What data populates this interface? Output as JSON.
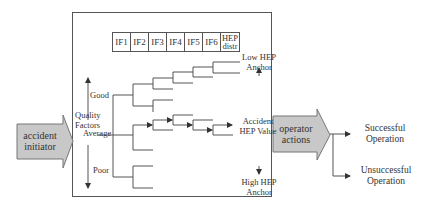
{
  "diagram": {
    "input_arrow": {
      "label_line1": "accident",
      "label_line2": "initiator",
      "fill": "#c8c8c8"
    },
    "output_arrow": {
      "label_line1": "operator",
      "label_line2": "actions",
      "fill": "#c8c8c8"
    },
    "influence_factors": [
      "IF1",
      "IF2",
      "IF3",
      "IF4",
      "IF5",
      "IF6"
    ],
    "hep_distr": {
      "line1": "HEP",
      "line2": "distr"
    },
    "quality_axis": {
      "title_line1": "Quality",
      "title_line2": "Factors",
      "levels": {
        "good": "Good",
        "average": "Average",
        "poor": "Poor"
      }
    },
    "anchors": {
      "low": {
        "line1": "Low HEP",
        "line2": "Anchor"
      },
      "value": {
        "line1": "Accident",
        "line2": "HEP Value"
      },
      "high": {
        "line1": "High HEP",
        "line2": "Anchor"
      }
    },
    "outcomes": {
      "success": {
        "line1": "Successful",
        "line2": "Operation"
      },
      "failure": {
        "line1": "Unsuccessful",
        "line2": "Operation"
      }
    },
    "colors": {
      "line": "#555555",
      "arrow_fill": "#c8c8c8",
      "text": "#333333"
    }
  }
}
